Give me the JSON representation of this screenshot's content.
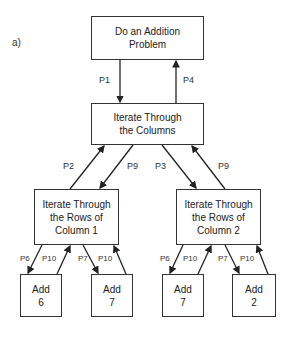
{
  "figure_label": "a)",
  "nodes": {
    "root": "Do an Addition\nProblem",
    "columns": "Iterate Through\nthe Columns",
    "rows1": "Iterate Through\nthe Rows of\nColumn 1",
    "rows2": "Iterate Through\nthe Rows of\nColumn 2",
    "add6": "Add\n6",
    "add7a": "Add\n7",
    "add7b": "Add\n7",
    "add2": "Add\n2"
  },
  "edges": {
    "p1": "P1",
    "p4": "P4",
    "p2": "P2",
    "p9a": "P9",
    "p3": "P3",
    "p9b": "P9",
    "p6a": "P6",
    "p10a": "P10",
    "p7a": "P7",
    "p10b": "P10",
    "p6b": "P6",
    "p10c": "P10",
    "p7b": "P7",
    "p10d": "P10"
  }
}
